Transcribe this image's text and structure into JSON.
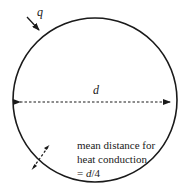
{
  "diagram": {
    "shape": "circle",
    "labels": {
      "heat_flux": "q",
      "diameter": "d",
      "annotation_line1": "mean distance for",
      "annotation_line2": "heat conduction",
      "annotation_line3_prefix": "= ",
      "annotation_line3_var": "d",
      "annotation_line3_suffix": "/4"
    },
    "colors": {
      "stroke": "#1a1a1a",
      "background": "#ffffff"
    }
  }
}
